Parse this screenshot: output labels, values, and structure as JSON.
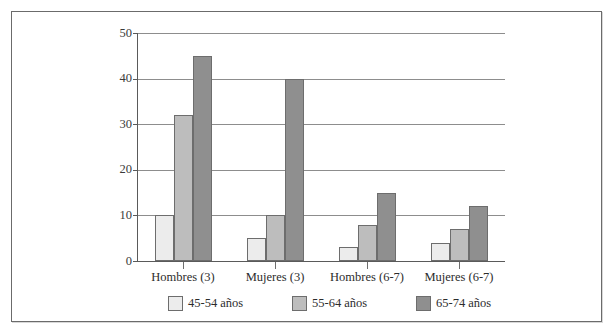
{
  "chart_data": {
    "type": "bar",
    "title": "",
    "subtitle": "",
    "xlabel": "",
    "ylabel": "",
    "categories": [
      "Hombres (3)",
      "Mujeres (3)",
      "Hombres (6-7)",
      "Mujeres (6-7)"
    ],
    "series": [
      {
        "name": "45-54 años",
        "color": "#ececec",
        "values": [
          10,
          5,
          3,
          4
        ]
      },
      {
        "name": "55-64 años",
        "color": "#bdbdbd",
        "values": [
          32,
          10,
          8,
          7
        ]
      },
      {
        "name": "65-74 años",
        "color": "#8f8f8f",
        "values": [
          45,
          40,
          15,
          12
        ]
      }
    ],
    "ylim": [
      0,
      50
    ],
    "yticks": [
      0,
      10,
      20,
      30,
      40,
      50
    ],
    "ytick_labels": [
      "0",
      "10",
      "20",
      "30",
      "40",
      "50"
    ],
    "grid": true,
    "grid_axis": "y",
    "legend_position": "bottom",
    "legend_entries": [
      "45-54 años",
      "55-64 años",
      "65-74 años"
    ],
    "annotations": [],
    "frame_border_color": "#6b6b6b",
    "gridline_color": "#8d8d8d",
    "axis_color": "#5a5a5a"
  },
  "axis": {
    "y": {
      "tick_0": "0",
      "tick_1": "10",
      "tick_2": "20",
      "tick_3": "30",
      "tick_4": "40",
      "tick_5": "50"
    },
    "x": {
      "tick_0": "Hombres (3)",
      "tick_1": "Mujeres (3)",
      "tick_2": "Hombres (6-7)",
      "tick_3": "Mujeres (6-7)"
    }
  },
  "legend": {
    "item_0": "45-54 años",
    "item_1": "55-64 años",
    "item_2": "65-74 años"
  }
}
